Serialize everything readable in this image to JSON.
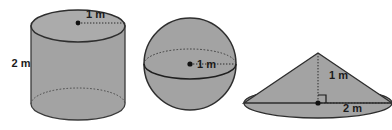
{
  "figure": {
    "background_color": "#ffffff",
    "fill_color": "#a3a3a3",
    "fill_color_light": "#ababab",
    "outline_color": "#3a3a3a",
    "label_color": "#1b1b1b",
    "shapes": [
      {
        "name": "cylinder",
        "labels": [
          {
            "id": "cylinder-radius",
            "text": "1 m",
            "x": 86,
            "y": 18,
            "measure": "radius"
          },
          {
            "id": "cylinder-height",
            "text": "2 m",
            "x": 21,
            "y": 67,
            "measure": "height"
          }
        ]
      },
      {
        "name": "sphere",
        "labels": [
          {
            "id": "sphere-radius",
            "text": "1 m",
            "x": 209,
            "y": 66,
            "measure": "radius"
          }
        ]
      },
      {
        "name": "cone",
        "labels": [
          {
            "id": "cone-height",
            "text": "1 m",
            "x": 337,
            "y": 75,
            "measure": "height"
          },
          {
            "id": "cone-radius",
            "text": "2 m",
            "x": 351,
            "y": 108,
            "measure": "radius"
          }
        ]
      }
    ]
  }
}
